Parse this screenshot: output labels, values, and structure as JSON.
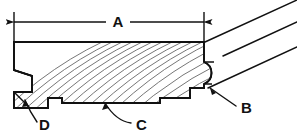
{
  "drawing": {
    "type": "engineering-cross-section",
    "subject": "tongue-and-groove flooring plank cross section",
    "background_color": "#ffffff",
    "line_color": "#111111",
    "hatch_color": "#555555",
    "width": 297,
    "height": 136,
    "dimension": {
      "label": "A",
      "description": "overall face width dimension line with arrowheads at both ends",
      "left_extension_x": 14,
      "right_extension_x": 204,
      "dimension_line_y": 22,
      "label_x": 118,
      "label_y": 27
    },
    "callouts": [
      {
        "label": "A",
        "kind": "dimension",
        "text_x": 118,
        "text_y": 27
      },
      {
        "label": "B",
        "kind": "leader",
        "target": "rounded tongue profile on right edge",
        "text_x": 241,
        "text_y": 111,
        "leader_from_x": 236,
        "leader_from_y": 105,
        "leader_to_x": 210,
        "leader_to_y": 88
      },
      {
        "label": "C",
        "kind": "leader",
        "target": "relief notch in underside of plank",
        "text_x": 136,
        "text_y": 128,
        "leader_from_x": 131,
        "leader_from_y": 122,
        "leader_to_x": 105,
        "leader_to_y": 103
      },
      {
        "label": "D",
        "kind": "leader",
        "target": "lower groove lip on left edge",
        "text_x": 40,
        "text_y": 128,
        "leader_from_x": 38,
        "leader_from_y": 122,
        "leader_to_x": 25,
        "leader_to_y": 101
      }
    ],
    "features": {
      "top_face_y": 42,
      "bottom_face_y": 108,
      "left_edge_x": 14,
      "right_edge_x": 204,
      "groove_side": "left",
      "tongue_side": "right",
      "break_lines_count": 3,
      "hatch_style": "curved wood grain"
    }
  }
}
